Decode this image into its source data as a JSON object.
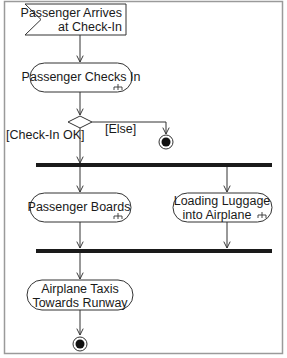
{
  "diagram": {
    "type": "UML activity diagram",
    "nodes": {
      "start_signal": {
        "line1": "Passenger Arrives",
        "line2": "at Check-In"
      },
      "checks_in": {
        "label": "Passenger Checks In"
      },
      "decision": {
        "guard_ok": "[Check-In OK]",
        "guard_else": "[Else]"
      },
      "boards": {
        "label": "Passenger Boards"
      },
      "luggage": {
        "line1": "Loading Luggage",
        "line2": "into Airplane"
      },
      "taxis": {
        "line1": "Airplane Taxis",
        "line2": "Towards Runway"
      }
    },
    "colors": {
      "stroke": "#333333",
      "bar": "#1a1a1a",
      "frame": "#9a9a9a",
      "text": "#1a1a1a"
    }
  }
}
